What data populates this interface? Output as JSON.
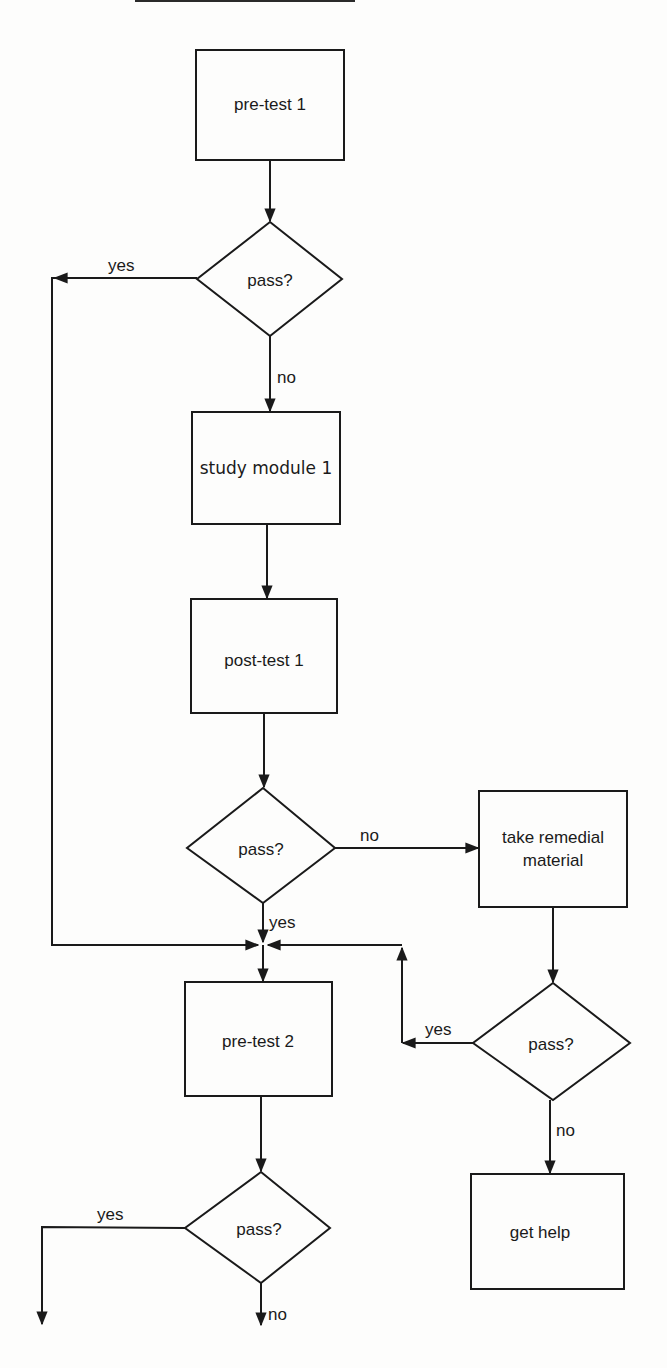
{
  "diagram": {
    "type": "flowchart",
    "nodes": {
      "pretest1": {
        "label": "pre-test 1",
        "shape": "process"
      },
      "decision1": {
        "label": "pass?",
        "shape": "decision"
      },
      "study1": {
        "label": "study module 1",
        "shape": "process"
      },
      "posttest1": {
        "label": "post-test 1",
        "shape": "process"
      },
      "decision2": {
        "label": "pass?",
        "shape": "decision"
      },
      "remedial": {
        "label_line1": "take remedial",
        "label_line2": "material",
        "shape": "process"
      },
      "decision3": {
        "label": "pass?",
        "shape": "decision"
      },
      "pretest2": {
        "label": "pre-test 2",
        "shape": "process"
      },
      "decision4": {
        "label": "pass?",
        "shape": "decision"
      },
      "gethelp": {
        "label": "get help",
        "shape": "process"
      }
    },
    "edge_labels": {
      "d1_yes": "yes",
      "d1_no": "no",
      "d2_no": "no",
      "d2_yes": "yes",
      "d3_yes": "yes",
      "d3_no": "no",
      "d4_yes": "yes",
      "d4_no": "no"
    },
    "edges": [
      {
        "from": "pre-test 1",
        "to": "pass? (1)"
      },
      {
        "from": "pass? (1)",
        "to": "study module 1",
        "label": "no"
      },
      {
        "from": "pass? (1)",
        "to": "pre-test 2",
        "label": "yes"
      },
      {
        "from": "study module 1",
        "to": "post-test 1"
      },
      {
        "from": "post-test 1",
        "to": "pass? (2)"
      },
      {
        "from": "pass? (2)",
        "to": "take remedial material",
        "label": "no"
      },
      {
        "from": "pass? (2)",
        "to": "pre-test 2",
        "label": "yes"
      },
      {
        "from": "take remedial material",
        "to": "pass? (3)"
      },
      {
        "from": "pass? (3)",
        "to": "pre-test 2",
        "label": "yes"
      },
      {
        "from": "pass? (3)",
        "to": "get help",
        "label": "no"
      },
      {
        "from": "pre-test 2",
        "to": "pass? (4)"
      },
      {
        "from": "pass? (4)",
        "to": "(continues below-left)",
        "label": "yes"
      },
      {
        "from": "pass? (4)",
        "to": "(continues below)",
        "label": "no"
      }
    ]
  }
}
